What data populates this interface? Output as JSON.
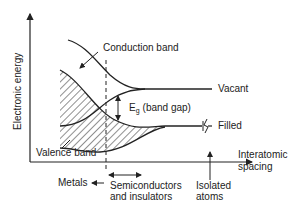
{
  "diagram": {
    "y_axis_label": "Electronic energy",
    "x_axis_label_line1": "Interatomic",
    "x_axis_label_line2": "spacing",
    "conduction_band": "Conduction band",
    "valence_band": "Valence band",
    "band_gap_symbol": "E",
    "band_gap_subscript": "g",
    "band_gap_text": "(band gap)",
    "vacant": "Vacant",
    "filled": "Filled",
    "metals": "Metals",
    "semiconductors_line1": "Semiconductors",
    "semiconductors_line2": "and insulators",
    "isolated_line1": "Isolated",
    "isolated_line2": "atoms",
    "line_color": "#222222"
  }
}
